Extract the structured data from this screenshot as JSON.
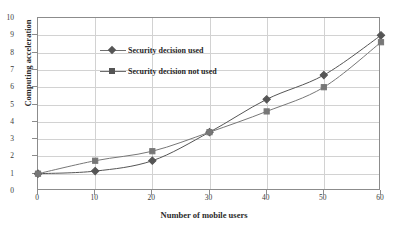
{
  "chart_data": {
    "type": "line",
    "title": "",
    "xlabel": "Number of mobile users",
    "ylabel": "Computing acceleration",
    "x": [
      0,
      10,
      20,
      30,
      40,
      50,
      60
    ],
    "xlim": [
      0,
      60
    ],
    "ylim": [
      0,
      10
    ],
    "xticks": [
      "0",
      "10",
      "20",
      "30",
      "40",
      "50",
      "60"
    ],
    "yticks": [
      "0",
      "1",
      "2",
      "3",
      "4",
      "5",
      "6",
      "7",
      "8",
      "9",
      "10"
    ],
    "grid": true,
    "legend_position": "upper-left-inside",
    "series": [
      {
        "name": "Security decision used",
        "marker": "diamond",
        "color": "#555555",
        "values": [
          1.0,
          1.15,
          1.75,
          3.4,
          5.3,
          6.7,
          9.0
        ]
      },
      {
        "name": "Security decision not used",
        "marker": "square",
        "color": "#777777",
        "values": [
          1.0,
          1.75,
          2.3,
          3.4,
          4.6,
          6.0,
          8.6
        ]
      }
    ]
  },
  "axes": {
    "x_title": "Number of mobile users",
    "y_title": "Computing acceleration"
  }
}
